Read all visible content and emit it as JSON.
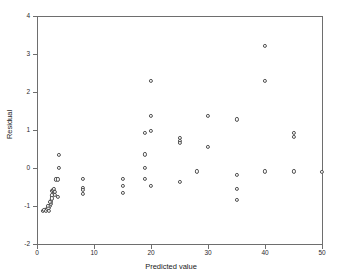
{
  "chart_data": {
    "type": "scatter",
    "title": "",
    "xlabel": "Predicted value",
    "ylabel": "Residual",
    "xlim": [
      0,
      50
    ],
    "ylim": [
      -2,
      4
    ],
    "xticks": [
      0,
      10,
      20,
      30,
      40,
      50
    ],
    "yticks": [
      -2,
      -1,
      0,
      1,
      2,
      3,
      4
    ],
    "xtick_labels": [
      "0",
      "10",
      "20",
      "30",
      "40",
      "50"
    ],
    "ytick_labels": [
      "-2",
      "-1",
      "0",
      "1",
      "2",
      "3",
      "4"
    ],
    "grid": false,
    "legend": null,
    "marker": "open-circle",
    "marker_color": "#4f4f4f",
    "series": [
      {
        "name": "residuals",
        "points": [
          [
            1.0,
            -1.12
          ],
          [
            1.3,
            -1.1
          ],
          [
            1.5,
            -1.13
          ],
          [
            1.8,
            -1.08
          ],
          [
            2.0,
            -1.05
          ],
          [
            2.1,
            -1.12
          ],
          [
            2.3,
            -1.0
          ],
          [
            2.4,
            -0.95
          ],
          [
            2.5,
            -0.88
          ],
          [
            2.6,
            -0.72
          ],
          [
            2.7,
            -0.6
          ],
          [
            2.8,
            -0.58
          ],
          [
            2.9,
            -0.63
          ],
          [
            3.0,
            -0.55
          ],
          [
            3.1,
            -0.62
          ],
          [
            3.2,
            -0.7
          ],
          [
            2.6,
            -0.8
          ],
          [
            2.2,
            -0.9
          ],
          [
            1.9,
            -1.0
          ],
          [
            3.3,
            -0.3
          ],
          [
            3.6,
            -0.3
          ],
          [
            3.9,
            0.35
          ],
          [
            3.9,
            0.0
          ],
          [
            3.6,
            -0.75
          ],
          [
            8.0,
            -0.28
          ],
          [
            8.0,
            -0.52
          ],
          [
            8.0,
            -0.58
          ],
          [
            8.0,
            -0.68
          ],
          [
            15.0,
            -0.28
          ],
          [
            15.0,
            -0.47
          ],
          [
            15.0,
            -0.65
          ],
          [
            19.0,
            0.92
          ],
          [
            19.0,
            0.36
          ],
          [
            19.0,
            0.0
          ],
          [
            19.0,
            -0.28
          ],
          [
            20.0,
            2.3
          ],
          [
            20.0,
            1.38
          ],
          [
            20.0,
            0.97
          ],
          [
            20.0,
            -0.47
          ],
          [
            25.0,
            0.8
          ],
          [
            25.0,
            0.72
          ],
          [
            25.0,
            0.65
          ],
          [
            25.0,
            -0.36
          ],
          [
            28.0,
            -0.09
          ],
          [
            30.0,
            1.38
          ],
          [
            30.0,
            0.55
          ],
          [
            35.0,
            1.28
          ],
          [
            35.0,
            -0.19
          ],
          [
            35.0,
            -0.56
          ],
          [
            35.0,
            -0.85
          ],
          [
            40.0,
            3.22
          ],
          [
            40.0,
            2.3
          ],
          [
            40.0,
            -0.09
          ],
          [
            45.0,
            0.92
          ],
          [
            45.0,
            0.82
          ],
          [
            45.0,
            -0.09
          ],
          [
            50.0,
            -0.1
          ]
        ]
      }
    ]
  }
}
